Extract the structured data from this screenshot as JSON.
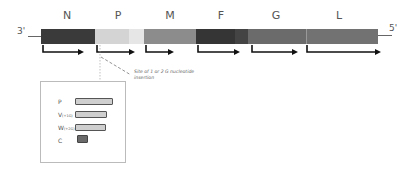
{
  "diagram": {
    "genes": [
      {
        "label": "N",
        "x": 67,
        "start": 41,
        "end": 95,
        "color": "#3a3a3a"
      },
      {
        "label": "P",
        "x": 118,
        "start": 95,
        "end": 144,
        "color": "#d9d9d9"
      },
      {
        "label": "M",
        "x": 170,
        "start": 144,
        "end": 196,
        "color": "#8c8c8c"
      },
      {
        "label": "F",
        "x": 221,
        "start": 196,
        "end": 248,
        "color": "#353535"
      },
      {
        "label": "G",
        "x": 276,
        "start": 248,
        "end": 306,
        "color": "#6b6b6b"
      },
      {
        "label": "L",
        "x": 339,
        "start": 306,
        "end": 378,
        "color": "#707070"
      }
    ],
    "end_3": "3'",
    "end_5": "5'",
    "annotation": "Site of 1 or 2 G nucleotide insertion",
    "products": [
      {
        "label": "P",
        "suffix": "",
        "width": 38
      },
      {
        "label": "V",
        "suffix": "(+1G)",
        "width": 32
      },
      {
        "label": "W",
        "suffix": "(+2G)",
        "width": 31
      },
      {
        "label": "C",
        "suffix": "",
        "width": 11
      }
    ]
  }
}
